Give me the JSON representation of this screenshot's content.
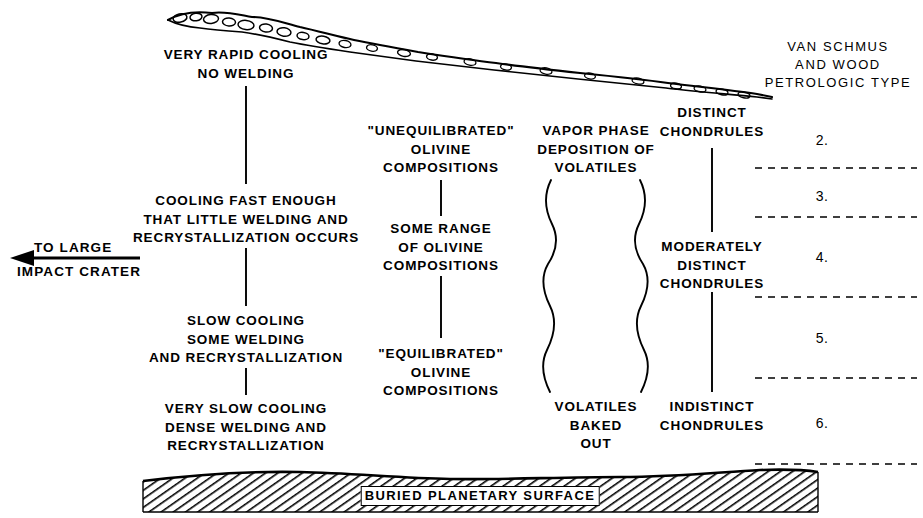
{
  "diagram": {
    "background_color": "#ffffff",
    "ink_color": "#000000"
  },
  "cooling_column": {
    "items": [
      {
        "id": "very-rapid-cooling",
        "text": "VERY RAPID COOLING\nNO WELDING"
      },
      {
        "id": "cooling-fast-enough",
        "text": "COOLING FAST ENOUGH\nTHAT LITTLE WELDING AND\nRECRYSTALLIZATION OCCURS"
      },
      {
        "id": "slow-cooling",
        "text": "SLOW COOLING\nSOME WELDING\nAND RECRYSTALLIZATION"
      },
      {
        "id": "very-slow-cooling",
        "text": "VERY SLOW COOLING\nDENSE WELDING AND\nRECRYSTALLIZATION"
      }
    ]
  },
  "olivine_column": {
    "items": [
      {
        "id": "unequilibrated-olivine",
        "text": "\"UNEQUILIBRATED\"\nOLIVINE\nCOMPOSITIONS"
      },
      {
        "id": "some-range-olivine",
        "text": "SOME RANGE\nOF OLIVINE\nCOMPOSITIONS"
      },
      {
        "id": "equilibrated-olivine",
        "text": "\"EQUILIBRATED\"\nOLIVINE\nCOMPOSITIONS"
      }
    ]
  },
  "volatiles_column": {
    "top_label": "VAPOR PHASE\nDEPOSITION OF\nVOLATILES",
    "bottom_label": "VOLATILES\nBAKED\nOUT"
  },
  "chondrules_column": {
    "items": [
      {
        "id": "distinct-chondrules",
        "text": "DISTINCT\nCHONDRULES"
      },
      {
        "id": "moderately-distinct-chondrules",
        "text": "MODERATELY\nDISTINCT\nCHONDRULES"
      },
      {
        "id": "indistinct-chondrules",
        "text": "INDISTINCT\nCHONDRULES"
      }
    ]
  },
  "petrologic_column": {
    "heading": "VAN SCHMUS\nAND WOOD\nPETROLOGIC TYPE",
    "types": [
      "2.",
      "3.",
      "4.",
      "5.",
      "6."
    ]
  },
  "impact_arrow": {
    "label_top": "TO LARGE",
    "label_bottom": "IMPACT CRATER",
    "direction": "left"
  },
  "buried_surface": {
    "label": "BURIED PLANETARY SURFACE"
  }
}
